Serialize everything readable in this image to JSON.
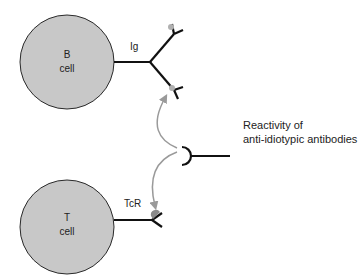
{
  "diagram": {
    "b_cell": {
      "line1": "B",
      "line2": "cell",
      "receptor_label": "Ig"
    },
    "t_cell": {
      "line1": "T",
      "line2": "cell",
      "receptor_label": "TcR"
    },
    "caption": {
      "line1": "Reactivity of",
      "line2": "anti-idiotypic antibodies"
    },
    "colors": {
      "cell_fill": "#c8c8c8",
      "cell_stroke": "#2a2a2a",
      "receptor_stroke": "#111111",
      "arrow": "#9a9a9a",
      "idiotype_patch": "#a8a8a8"
    }
  }
}
